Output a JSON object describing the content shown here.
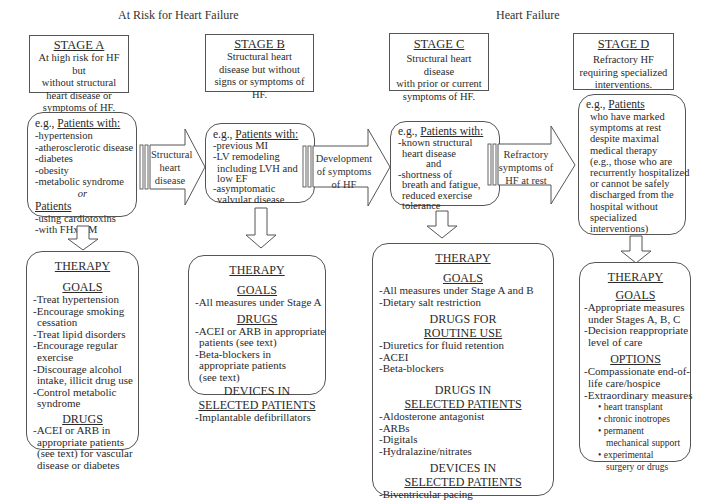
{
  "headers": {
    "at_risk": "At Risk for Heart Failure",
    "heart_failure": "Heart Failure"
  },
  "stages": [
    {
      "title": "STAGE A",
      "lines": [
        "At high risk for HF but",
        "without structural",
        "heart disease or",
        "symptoms of HF."
      ]
    },
    {
      "title": "STAGE B",
      "lines": [
        "Structural heart",
        "disease but without",
        "signs or symptoms of",
        "HF."
      ]
    },
    {
      "title": "STAGE C",
      "lines": [
        "Structural heart disease",
        "with prior or current",
        "symptoms of HF."
      ]
    },
    {
      "title": "STAGE D",
      "lines": [
        "Refractory HF",
        "requiring specialized",
        "interventions."
      ]
    }
  ],
  "patients": {
    "a": {
      "eg": "e.g., ",
      "head": "Patients with:",
      "items": [
        "-hypertension",
        "-atherosclerotic disease",
        "-diabetes",
        "-obesity",
        "-metabolic syndrome"
      ],
      "or": "or",
      "head2": "Patients",
      "items2": [
        "-using cardiotoxins",
        "-with FHx CM"
      ]
    },
    "b": {
      "eg": "e.g., ",
      "head": "Patients with:",
      "items": [
        "-previous MI",
        "-LV remodeling",
        "including LVH and",
        "low EF",
        "-asymptomatic",
        "valvular disease"
      ]
    },
    "c": {
      "eg": "e.g., ",
      "head": "Patients with:",
      "items": [
        "-known structural",
        "heart disease",
        "and",
        "-shortness of",
        "breath and fatigue,",
        "reduced exercise",
        "tolerance"
      ]
    },
    "d": {
      "eg": "e.g., ",
      "head": "Patients",
      "items": [
        "who have marked",
        "symptoms at rest",
        "despite maximal",
        "medical therapy",
        "(e.g., those who are",
        "recurrently hospitalized",
        "or cannot be safely",
        "discharged from the",
        "hospital without",
        "specialized",
        "interventions)"
      ]
    }
  },
  "transitions": [
    {
      "lines": [
        "Structural",
        "heart",
        "disease"
      ]
    },
    {
      "lines": [
        "Development",
        "of symptoms",
        "of HF"
      ]
    },
    {
      "lines": [
        "Refractory",
        "symptoms of",
        "HF at rest"
      ]
    }
  ],
  "therapy": {
    "a": {
      "title": "THERAPY",
      "goals_label": "GOALS",
      "goals": [
        "-Treat hypertension",
        "-Encourage smoking",
        "cessation",
        "-Treat lipid disorders",
        "-Encourage regular",
        "exercise",
        "-Discourage alcohol",
        "intake, illicit drug use",
        "-Control metabolic",
        "syndrome"
      ],
      "drugs_label": "DRUGS",
      "drugs": [
        "-ACEI or ARB in",
        "appropriate patients",
        "(see text) for vascular",
        "disease or diabetes"
      ]
    },
    "b": {
      "title": "THERAPY",
      "goals_label": "GOALS",
      "goals": [
        "-All measures under Stage A"
      ],
      "drugs_label": "DRUGS",
      "drugs": [
        "-ACEI or ARB in appropriate",
        "patients (see text)",
        "-Beta-blockers in",
        "appropriate patients",
        "(see text)"
      ],
      "devices_label_1": "DEVICES IN",
      "devices_label_2": "SELECTED PATIENTS",
      "devices": [
        "-Implantable defibrillators"
      ]
    },
    "c": {
      "title": "THERAPY",
      "goals_label": "GOALS",
      "goals": [
        "-All measures under Stage A and B",
        "-Dietary salt restriction"
      ],
      "routine_label_1": "DRUGS FOR",
      "routine_label_2": "ROUTINE USE",
      "routine": [
        "-Diuretics for fluid retention",
        "-ACEI",
        "-Beta-blockers"
      ],
      "selected_label_1": "DRUGS IN",
      "selected_label_2": "SELECTED PATIENTS",
      "selected": [
        "-Aldosterone antagonist",
        "-ARBs",
        "-Digitals",
        "-Hydralazine/nitrates"
      ],
      "devices_label_1": "DEVICES IN",
      "devices_label_2": "SELECTED PATIENTS",
      "devices": [
        "-Biventricular pacing",
        "-Implantable defibrillators"
      ]
    },
    "d": {
      "title": "THERAPY",
      "goals_label": "GOALS",
      "goals": [
        "-Appropriate measures",
        "under Stages A, B, C",
        "-Decision reappropriate",
        "level of care"
      ],
      "options_label": "OPTIONS",
      "options": [
        "-Compassionate end-of-",
        "life care/hospice",
        "-Extraordinary measures"
      ],
      "bullets": [
        "heart transplant",
        "chronic inotropes",
        "permanent",
        "mechanical support",
        "experimental",
        "surgery or drugs"
      ]
    }
  }
}
